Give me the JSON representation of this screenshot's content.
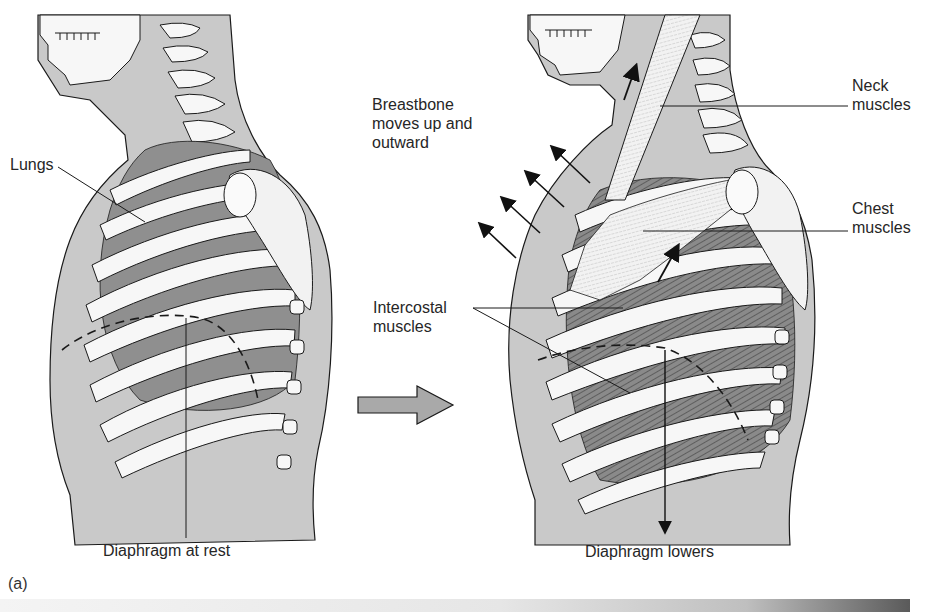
{
  "figure": {
    "panel_label": "(a)",
    "colors": {
      "background": "#ffffff",
      "body_fill": "#c9c9c9",
      "lung_fill": "#8f8f8f",
      "muscle_fill": "#7d7d7d",
      "bone_fill": "#f7f7f7",
      "outline": "#1a1a1a",
      "transition_arrow_fill": "#a9a9a9"
    },
    "left_panel": {
      "state": "rest",
      "labels": {
        "lungs": "Lungs",
        "diaphragm": "Diaphragm at rest"
      }
    },
    "transition_arrow": {
      "direction": "right",
      "meaning": "leads-to"
    },
    "right_panel": {
      "state": "inhalation",
      "labels": {
        "breastbone": "Breastbone\nmoves up and\noutward",
        "neck_muscles": "Neck\nmuscles",
        "chest_muscles": "Chest\nmuscles",
        "intercostal_muscles": "Intercostal\nmuscles",
        "diaphragm": "Diaphragm lowers"
      },
      "breastbone_arrow_count": 4
    }
  }
}
